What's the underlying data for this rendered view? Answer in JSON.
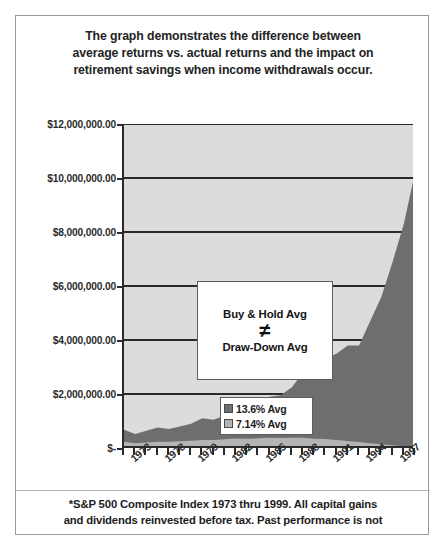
{
  "title": {
    "line1": "The graph demonstrates the difference between",
    "line2": "average returns vs. actual returns and the impact on",
    "line3": "retirement savings when income withdrawals occur."
  },
  "callout": {
    "top_label": "Buy & Hold Avg",
    "operator": "≠",
    "bottom_label": "Draw-Down Avg"
  },
  "footnote": {
    "line1": "*S&P 500 Composite Index 1973 thru 1999. All capital gains",
    "line2": "and dividends reinvested before tax. Past performance is not"
  },
  "colors": {
    "series_buy_hold": "#6e6e6e",
    "series_draw_down": "#b4b4b4",
    "plot_background": "#dcdcdc",
    "axis": "#2a2a2a",
    "gridline": "#2a2a2a",
    "text": "#1d1d1d"
  },
  "chart_data": {
    "type": "area",
    "title": "",
    "subtitle": "",
    "xlabel": "",
    "ylabel": "",
    "grid": true,
    "legend_position": "inside-center",
    "ylim": [
      0,
      12000000
    ],
    "ytick_labels": [
      "$12,000,000.00",
      "$10,000,000.00",
      "$8,000,000.00",
      "$6,000,000.00",
      "$4,000,000.00",
      "$2,000,000.00",
      "$-"
    ],
    "ytick_values": [
      12000000,
      10000000,
      8000000,
      6000000,
      4000000,
      2000000,
      0
    ],
    "xtick_labels": [
      "1973",
      "1978",
      "1979",
      "1982",
      "1985",
      "1988",
      "1991",
      "1994",
      "1997"
    ],
    "xtick_count": 27,
    "x": [
      1973,
      1974,
      1975,
      1976,
      1977,
      1978,
      1979,
      1980,
      1981,
      1982,
      1983,
      1984,
      1985,
      1986,
      1987,
      1988,
      1989,
      1990,
      1991,
      1992,
      1993,
      1994,
      1995,
      1996,
      1997,
      1998,
      1999
    ],
    "series": [
      {
        "name": "13.6% Avg",
        "color": "#6e6e6e",
        "values": [
          680000,
          520000,
          640000,
          760000,
          700000,
          800000,
          900000,
          1100000,
          1050000,
          1200000,
          1400000,
          1400000,
          1650000,
          1900000,
          1950000,
          2250000,
          2800000,
          2700000,
          3300000,
          3500000,
          3800000,
          3800000,
          4700000,
          5600000,
          6900000,
          8300000,
          10200000
        ]
      },
      {
        "name": "7.14% Avg",
        "color": "#b4b4b4",
        "values": [
          230000,
          180000,
          200000,
          230000,
          230000,
          250000,
          270000,
          300000,
          300000,
          320000,
          350000,
          340000,
          360000,
          380000,
          370000,
          380000,
          380000,
          340000,
          330000,
          300000,
          260000,
          220000,
          180000,
          140000,
          100000,
          60000,
          30000
        ]
      }
    ]
  }
}
